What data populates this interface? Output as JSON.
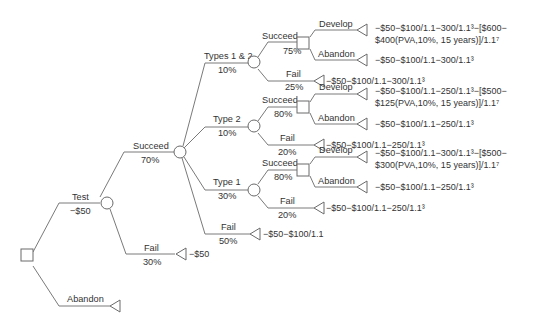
{
  "diagram": {
    "type": "decision-tree",
    "root": {
      "node_type": "decision",
      "branches": [
        {
          "label": "Test",
          "value": "−$50",
          "node_type": "chance",
          "branches": [
            {
              "label": "Succeed",
              "value": "70%",
              "node_type": "chance",
              "branches": [
                {
                  "label": "Types 1 & 2",
                  "value": "10%",
                  "node_type": "chance",
                  "branches": [
                    {
                      "label": "Succeed",
                      "value": "75%",
                      "node_type": "decision",
                      "branches": [
                        {
                          "label": "Develop",
                          "payoff_line1": "−$50−$100/1.1−300/1.1³−[$600−",
                          "payoff_line2": "$400(PVA,10%, 15 years)]/1.1⁷"
                        },
                        {
                          "label": "Abandon",
                          "payoff": "−$50−$100/1.1−300/1.1³"
                        }
                      ]
                    },
                    {
                      "label": "Fail",
                      "value": "25%",
                      "payoff": "−$50−$100/1.1−300/1.1³"
                    }
                  ]
                },
                {
                  "label": "Type 2",
                  "value": "10%",
                  "node_type": "chance",
                  "branches": [
                    {
                      "label": "Succeed",
                      "value": "80%",
                      "node_type": "decision",
                      "branches": [
                        {
                          "label": "Develop",
                          "payoff_line1": "−$50−$100/1.1−250/1.1³−[$500−",
                          "payoff_line2": "$125(PVA,10%, 15 years)]/1.1⁷"
                        },
                        {
                          "label": "Abandon",
                          "payoff": "−$50−$100/1.1−250/1.1³"
                        }
                      ]
                    },
                    {
                      "label": "Fail",
                      "value": "20%",
                      "payoff": "−$50−$100/1.1−250/1.1³"
                    }
                  ]
                },
                {
                  "label": "Type 1",
                  "value": "30%",
                  "node_type": "chance",
                  "branches": [
                    {
                      "label": "Succeed",
                      "value": "80%",
                      "node_type": "decision",
                      "branches": [
                        {
                          "label": "Develop",
                          "payoff_line1": "−$50−$100/1.1−300/1.1³−[$500−",
                          "payoff_line2": "$300(PVA,10%, 15 years)]/1.1⁷"
                        },
                        {
                          "label": "Abandon",
                          "payoff": "−$50−$100/1.1−250/1.1³"
                        }
                      ]
                    },
                    {
                      "label": "Fail",
                      "value": "20%",
                      "payoff": "−$50−$100/1.1−250/1.1³"
                    }
                  ]
                },
                {
                  "label": "Fail",
                  "value": "50%",
                  "payoff": "−$50−$100/1.1"
                }
              ]
            },
            {
              "label": "Fail",
              "value": "30%",
              "payoff": "−$50"
            }
          ]
        },
        {
          "label": "Abandon"
        }
      ]
    }
  }
}
